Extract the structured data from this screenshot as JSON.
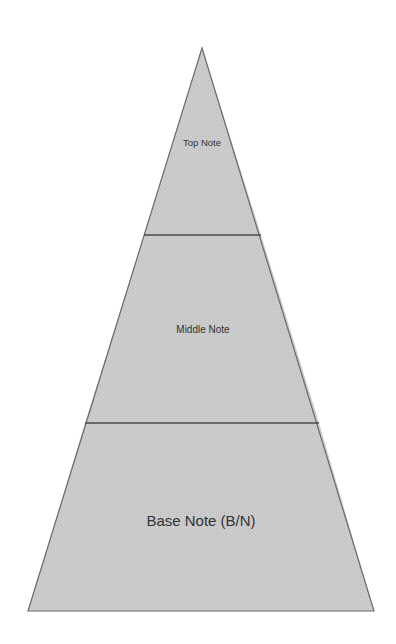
{
  "diagram": {
    "type": "pyramid",
    "fill_color": "#c9c9c9",
    "outline_color": "#6a6a6a",
    "divider_color": "#4a4a4a",
    "layers": [
      {
        "label": "Top Note",
        "position": "top"
      },
      {
        "label": "Middle Note",
        "position": "middle"
      },
      {
        "label": "Base Note (B/N)",
        "position": "bottom"
      }
    ]
  }
}
